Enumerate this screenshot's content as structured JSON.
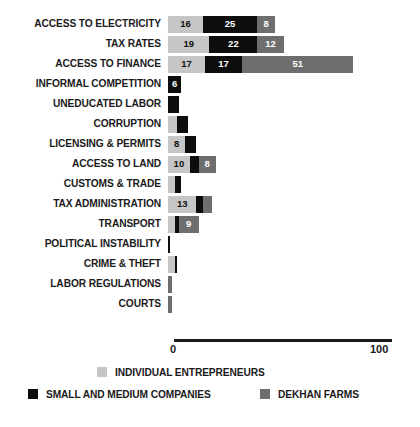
{
  "chart_data": {
    "type": "bar",
    "orientation": "horizontal",
    "stacked": true,
    "title": "",
    "subtitle": "",
    "xlabel": "",
    "ylabel": "",
    "xlim": [
      0,
      100
    ],
    "grid": false,
    "legend_position": "bottom",
    "axis": {
      "tick_labels": [
        "0",
        "100"
      ],
      "min": 0,
      "max": 100
    },
    "series": [
      {
        "name": "INDIVIDUAL ENTREPRENEURS",
        "key": "ie",
        "color": "#c6c6c6"
      },
      {
        "name": "SMALL AND MEDIUM COMPANIES",
        "key": "smc",
        "color": "#0d0d0d"
      },
      {
        "name": "DEKHAN FARMS",
        "key": "dkf",
        "color": "#6e6e6e"
      }
    ],
    "categories": [
      "ACCESS TO ELECTRICITY",
      "TAX RATES",
      "ACCESS TO FINANCE",
      "INFORMAL COMPETITION",
      "UNEDUCATED LABOR",
      "CORRUPTION",
      "LICENSING & PERMITS",
      "ACCESS TO LAND",
      "CUSTOMS & TRADE",
      "TAX ADMINISTRATION",
      "TRANSPORT",
      "POLITICAL INSTABILITY",
      "CRIME & THEFT",
      "LABOR REGULATIONS",
      "COURTS"
    ],
    "rows": [
      {
        "category": "ACCESS TO ELECTRICITY",
        "segments": [
          {
            "series": "ie",
            "value": 16,
            "label": "16"
          },
          {
            "series": "smc",
            "value": 25,
            "label": "25"
          },
          {
            "series": "dkf",
            "value": 8,
            "label": "8"
          }
        ]
      },
      {
        "category": "TAX RATES",
        "segments": [
          {
            "series": "ie",
            "value": 19,
            "label": "19"
          },
          {
            "series": "smc",
            "value": 22,
            "label": "22"
          },
          {
            "series": "dkf",
            "value": 12,
            "label": "12"
          }
        ]
      },
      {
        "category": "ACCESS TO FINANCE",
        "segments": [
          {
            "series": "ie",
            "value": 17,
            "label": "17"
          },
          {
            "series": "smc",
            "value": 17,
            "label": "17"
          },
          {
            "series": "dkf",
            "value": 51,
            "label": "51"
          }
        ]
      },
      {
        "category": "INFORMAL COMPETITION",
        "segments": [
          {
            "series": "smc",
            "value": 6,
            "label": "6"
          }
        ]
      },
      {
        "category": "UNEDUCATED LABOR",
        "segments": [
          {
            "series": "smc",
            "value": 5,
            "label": "5"
          }
        ]
      },
      {
        "category": "CORRUPTION",
        "segments": [
          {
            "series": "ie",
            "value": 4,
            "label": "4"
          },
          {
            "series": "smc",
            "value": 5,
            "label": "5"
          }
        ]
      },
      {
        "category": "LICENSING & PERMITS",
        "segments": [
          {
            "series": "ie",
            "value": 8,
            "label": "8"
          },
          {
            "series": "smc",
            "value": 5,
            "label": "5"
          }
        ]
      },
      {
        "category": "ACCESS TO LAND",
        "segments": [
          {
            "series": "ie",
            "value": 10,
            "label": "10"
          },
          {
            "series": "smc",
            "value": 4,
            "label": "4"
          },
          {
            "series": "dkf",
            "value": 8,
            "label": "8"
          }
        ]
      },
      {
        "category": "CUSTOMS & TRADE",
        "segments": [
          {
            "series": "ie",
            "value": 3,
            "label": "3"
          },
          {
            "series": "smc",
            "value": 3,
            "label": "3"
          }
        ]
      },
      {
        "category": "TAX ADMINISTRATION",
        "segments": [
          {
            "series": "ie",
            "value": 13,
            "label": "13"
          },
          {
            "series": "smc",
            "value": 3,
            "label": "3"
          },
          {
            "series": "dkf",
            "value": 4,
            "label": "4"
          }
        ]
      },
      {
        "category": "TRANSPORT",
        "segments": [
          {
            "series": "ie",
            "value": 3,
            "label": "3"
          },
          {
            "series": "smc",
            "value": 2,
            "label": ""
          },
          {
            "series": "dkf",
            "value": 9,
            "label": "9"
          }
        ]
      },
      {
        "category": "POLITICAL INSTABILITY",
        "segments": [
          {
            "series": "smc",
            "value": 1,
            "label": ""
          }
        ]
      },
      {
        "category": "CRIME & THEFT",
        "segments": [
          {
            "series": "ie",
            "value": 3,
            "label": "3"
          },
          {
            "series": "smc",
            "value": 1,
            "label": ""
          }
        ]
      },
      {
        "category": "LABOR REGULATIONS",
        "segments": [
          {
            "series": "dkf",
            "value": 2,
            "label": ""
          }
        ]
      },
      {
        "category": "COURTS",
        "segments": [
          {
            "series": "dkf",
            "value": 2,
            "label": ""
          }
        ]
      }
    ]
  },
  "legend": {
    "items": [
      {
        "label": "INDIVIDUAL ENTREPRENEURS",
        "color": "#c6c6c6"
      },
      {
        "label": "SMALL AND MEDIUM COMPANIES",
        "color": "#0d0d0d"
      },
      {
        "label": "DEKHAN FARMS",
        "color": "#6e6e6e"
      }
    ]
  }
}
